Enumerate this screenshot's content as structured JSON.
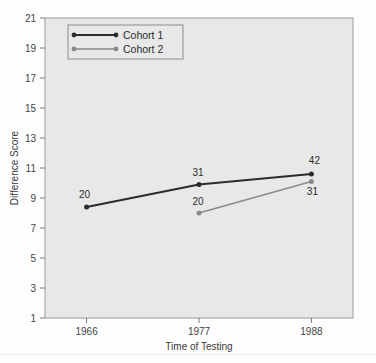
{
  "chart_data": {
    "type": "line",
    "title": "",
    "subtitle": "",
    "xlabel": "Time of Testing",
    "ylabel": "Difference Score",
    "categories": [
      "1966",
      "1977",
      "1988"
    ],
    "x": [
      1966,
      1977,
      1988
    ],
    "xtick_labels": [
      "1966",
      "1977",
      "1988"
    ],
    "ytick_labels": [
      "1",
      "3",
      "5",
      "7",
      "9",
      "11",
      "13",
      "15",
      "17",
      "19",
      "21"
    ],
    "yticks": [
      1,
      3,
      5,
      7,
      9,
      11,
      13,
      15,
      17,
      19,
      21
    ],
    "ylim": [
      1,
      21
    ],
    "grid": false,
    "legend_position": "top-left",
    "series": [
      {
        "name": "Cohort 1",
        "color": "#2b2b2b",
        "values": [
          8.4,
          9.9,
          10.6
        ],
        "point_labels": [
          "20",
          "31",
          "42"
        ]
      },
      {
        "name": "Cohort 2",
        "color": "#8a8a8a",
        "values": [
          null,
          8.0,
          10.1
        ],
        "point_labels": [
          null,
          "20",
          "31"
        ]
      }
    ],
    "annotations": [
      {
        "text": "20",
        "series": "Cohort 1",
        "x": 1966,
        "y": 8.4
      },
      {
        "text": "31",
        "series": "Cohort 1",
        "x": 1977,
        "y": 9.9
      },
      {
        "text": "42",
        "series": "Cohort 1",
        "x": 1988,
        "y": 10.6
      },
      {
        "text": "20",
        "series": "Cohort 2",
        "x": 1977,
        "y": 8.0
      },
      {
        "text": "31",
        "series": "Cohort 2",
        "x": 1988,
        "y": 10.1
      }
    ]
  },
  "legend": {
    "entries": [
      {
        "label": "Cohort 1",
        "color": "#2b2b2b"
      },
      {
        "label": "Cohort 2",
        "color": "#8a8a8a"
      }
    ]
  },
  "colors": {
    "plot_background": "#e8e8e8",
    "page_background": "#fdfdfd",
    "axis": "#7a7a7a",
    "series_1": "#2b2b2b",
    "series_2": "#8a8a8a",
    "text": "#3a3a3a"
  },
  "axis": {
    "y_title": "Difference Score",
    "x_title": "Time of Testing"
  }
}
